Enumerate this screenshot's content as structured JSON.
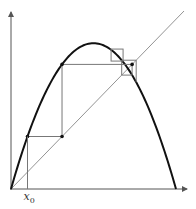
{
  "diagram": {
    "title": "",
    "type": "cobweb-plot",
    "map": "logistic map f(x) = r·x·(1−x)",
    "r": 2.8,
    "x0": 0.1,
    "x_label_main": "x",
    "x_label_sub": "0",
    "iterations": 4,
    "colors": {
      "curve": "#111111",
      "diagonal": "#777777",
      "cobweb": "#777777",
      "axis": "#555555"
    }
  }
}
